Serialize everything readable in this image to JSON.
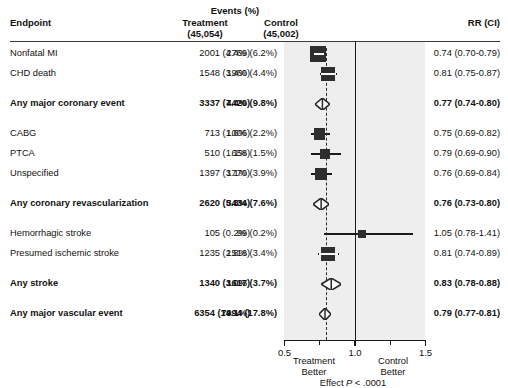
{
  "header": {
    "endpoint_label": "Endpoint",
    "events_group_label": "Events (%)",
    "treatment_label": "Treatment",
    "treatment_n": "(45,054)",
    "control_label": "Control",
    "control_n": "(45,002)",
    "rr_label": "RR (CI)"
  },
  "axis": {
    "ticks": [
      "0.5",
      "1.0",
      "1.5"
    ],
    "tick_values": [
      0.5,
      1.0,
      1.5
    ],
    "xmin": 0.5,
    "xmax": 1.5,
    "left_caption_line1": "Treatment",
    "left_caption_line2": "Better",
    "right_caption_line1": "Control",
    "right_caption_line2": "Better",
    "effect_prefix": "Effect",
    "effect_italic": "P",
    "effect_suffix": "< .0001",
    "reference_value": 1.0,
    "dashed_value": 0.79
  },
  "colors": {
    "plot_band": "#eeeeee",
    "marker": "#2e2e2e",
    "line": "#1a1a1a",
    "text": "#111111",
    "page": "#ffffff"
  },
  "chart_data": {
    "type": "forest",
    "title": "",
    "xlabel": "",
    "ylabel": "",
    "xlim": [
      0.5,
      1.5
    ],
    "grid": false,
    "legend": "none",
    "reference_line": 1.0,
    "pooled_line": 0.79,
    "columns": [
      "Endpoint",
      "Treatment",
      "Control",
      "RR (CI)"
    ],
    "rows": [
      {
        "endpoint": "Nonfatal MI",
        "treatment": "2001 (4.4%)",
        "control": "2769 (6.2%)",
        "rr_text": "0.74 (0.70-0.79)",
        "rr": 0.74,
        "lo": 0.7,
        "hi": 0.79,
        "marker": "square",
        "weight": 1.0,
        "bold": false,
        "gap_before": 0
      },
      {
        "endpoint": "CHD death",
        "treatment": "1548 (3.4%)",
        "control": "1960 (4.4%)",
        "rr_text": "0.81 (0.75-0.87)",
        "rr": 0.81,
        "lo": 0.75,
        "hi": 0.87,
        "marker": "square",
        "weight": 0.82,
        "bold": false,
        "gap_before": 0
      },
      {
        "endpoint": "Any major coronary event",
        "treatment": "3337 (7.4%)",
        "control": "4420 (9.8%)",
        "rr_text": "0.77 (0.74-0.80)",
        "rr": 0.77,
        "lo": 0.74,
        "hi": 0.8,
        "marker": "diamond",
        "weight": 1.0,
        "bold": true,
        "gap_before": 1
      },
      {
        "endpoint": "CABG",
        "treatment": "713 (1.6%)",
        "control": "1006 (2.2%)",
        "rr_text": "0.75 (0.69-0.82)",
        "rr": 0.75,
        "lo": 0.69,
        "hi": 0.82,
        "marker": "square",
        "weight": 0.55,
        "bold": false,
        "gap_before": 1
      },
      {
        "endpoint": "PTCA",
        "treatment": "510 (1.1%)",
        "control": "658 (1.5%)",
        "rr_text": "0.79 (0.69-0.90)",
        "rr": 0.79,
        "lo": 0.69,
        "hi": 0.9,
        "marker": "square",
        "weight": 0.46,
        "bold": false,
        "gap_before": 0
      },
      {
        "endpoint": "Unspecified",
        "treatment": "1397 (3.1%)",
        "control": "1770 (3.9%)",
        "rr_text": "0.76 (0.69-0.84)",
        "rr": 0.76,
        "lo": 0.69,
        "hi": 0.84,
        "marker": "square",
        "weight": 0.62,
        "bold": false,
        "gap_before": 0
      },
      {
        "endpoint": "Any coronary revascularization",
        "treatment": "2620 (5.8%)",
        "control": "3434 (7.6%)",
        "rr_text": "0.76 (0.73-0.80)",
        "rr": 0.76,
        "lo": 0.73,
        "hi": 0.8,
        "marker": "diamond",
        "weight": 1.0,
        "bold": true,
        "gap_before": 1
      },
      {
        "endpoint": "Hemorrhagic stroke",
        "treatment": "105 (0.2%)",
        "control": "99 (0.2%)",
        "rr_text": "1.05 (0.78-1.41)",
        "rr": 1.05,
        "lo": 0.78,
        "hi": 1.41,
        "marker": "square",
        "weight": 0.26,
        "bold": false,
        "gap_before": 1
      },
      {
        "endpoint": "Presumed ischemic stroke",
        "treatment": "1235 (2.8%)",
        "control": "1518 (3.4%)",
        "rr_text": "0.81 (0.74-0.89)",
        "rr": 0.81,
        "lo": 0.74,
        "hi": 0.89,
        "marker": "square",
        "weight": 0.8,
        "bold": false,
        "gap_before": 0
      },
      {
        "endpoint": "Any stroke",
        "treatment": "1340 (3.0%)",
        "control": "1617 (3.7%)",
        "rr_text": "0.83 (0.78-0.88)",
        "rr": 0.83,
        "lo": 0.78,
        "hi": 0.88,
        "marker": "diamond",
        "weight": 1.0,
        "bold": true,
        "gap_before": 1
      },
      {
        "endpoint": "Any major vascular event",
        "treatment": "6354 (14.1%)",
        "control": "7994 (17.8%)",
        "rr_text": "0.79 (0.77-0.81)",
        "rr": 0.79,
        "lo": 0.77,
        "hi": 0.81,
        "marker": "diamond",
        "weight": 1.0,
        "bold": true,
        "gap_before": 1
      }
    ]
  }
}
